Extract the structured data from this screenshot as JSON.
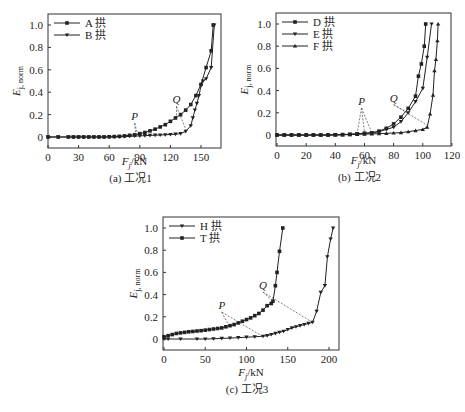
{
  "chart_data": [
    {
      "type": "line",
      "panel": "a",
      "caption": "(a) 工况1",
      "xlabel": "F_j/kN",
      "ylabel": "E_j, norm",
      "xlim": [
        0,
        170
      ],
      "ylim": [
        -0.1,
        1.1
      ],
      "xticks": [
        0,
        30,
        60,
        90,
        120,
        150
      ],
      "yticks": [
        0,
        0.2,
        0.4,
        0.6,
        0.8,
        1.0
      ],
      "ytick_labels": [
        "0",
        "0.2",
        "0.4",
        "0.6",
        "0.8",
        "1.0"
      ],
      "legend_position": "upper-left",
      "series": [
        {
          "name": "A 拱",
          "marker": "square",
          "x": [
            0,
            10,
            20,
            25,
            30,
            35,
            40,
            45,
            50,
            55,
            60,
            65,
            70,
            75,
            80,
            85,
            90,
            95,
            100,
            105,
            110,
            115,
            120,
            125,
            130,
            135,
            140,
            145,
            150,
            155,
            160,
            162
          ],
          "y": [
            0,
            0,
            0,
            0,
            0,
            0,
            0,
            0,
            0,
            0,
            0.002,
            0.004,
            0.006,
            0.01,
            0.015,
            0.02,
            0.03,
            0.04,
            0.055,
            0.07,
            0.09,
            0.11,
            0.14,
            0.17,
            0.2,
            0.24,
            0.29,
            0.37,
            0.47,
            0.62,
            0.77,
            1.0
          ]
        },
        {
          "name": "B 拱",
          "marker": "triangle-down",
          "x": [
            0,
            10,
            20,
            25,
            30,
            35,
            40,
            45,
            50,
            55,
            60,
            65,
            70,
            75,
            80,
            85,
            90,
            95,
            100,
            105,
            110,
            115,
            120,
            125,
            130,
            135,
            140,
            142,
            144,
            146,
            148,
            150,
            152,
            155,
            160,
            163
          ],
          "y": [
            0,
            0,
            0,
            0,
            0,
            0,
            0,
            0,
            0,
            0,
            0,
            0,
            0.002,
            0.004,
            0.006,
            0.008,
            0.01,
            0.012,
            0.014,
            0.016,
            0.018,
            0.02,
            0.022,
            0.025,
            0.03,
            0.05,
            0.1,
            0.17,
            0.24,
            0.3,
            0.37,
            0.46,
            0.5,
            0.52,
            0.62,
            1.0
          ]
        }
      ],
      "annotations": [
        {
          "text": "P",
          "x": 85,
          "y": 0.15,
          "points_to": [
            [
              86,
              0.02
            ],
            [
              88,
              0.02
            ]
          ]
        },
        {
          "text": "Q",
          "x": 126,
          "y": 0.3,
          "points_to": [
            [
              126,
              0.18
            ],
            [
              136,
              0.05
            ]
          ]
        }
      ]
    },
    {
      "type": "line",
      "panel": "b",
      "caption": "(b) 工况2",
      "xlabel": "F_j/kN",
      "ylabel": "E_j, norm",
      "xlim": [
        0,
        120
      ],
      "ylim": [
        -0.1,
        1.1
      ],
      "xticks": [
        0,
        20,
        40,
        60,
        80,
        100,
        120
      ],
      "yticks": [
        0,
        0.2,
        0.4,
        0.6,
        0.8,
        1.0
      ],
      "ytick_labels": [
        "0",
        "0.2",
        "0.4",
        "0.6",
        "0.8",
        "1.0"
      ],
      "legend_position": "upper-left",
      "series": [
        {
          "name": "D 拱",
          "marker": "square",
          "x": [
            0,
            5,
            10,
            15,
            20,
            25,
            30,
            35,
            40,
            45,
            50,
            55,
            60,
            65,
            70,
            75,
            80,
            85,
            90,
            95,
            97,
            99,
            101,
            102
          ],
          "y": [
            0,
            0,
            0,
            0,
            0,
            0,
            0,
            0,
            0.002,
            0.004,
            0.006,
            0.01,
            0.015,
            0.02,
            0.035,
            0.06,
            0.1,
            0.16,
            0.24,
            0.35,
            0.53,
            0.64,
            0.8,
            1.0
          ]
        },
        {
          "name": "E 拱",
          "marker": "triangle-down",
          "x": [
            0,
            5,
            10,
            15,
            20,
            25,
            30,
            35,
            40,
            45,
            50,
            55,
            60,
            65,
            70,
            75,
            80,
            85,
            90,
            95,
            100,
            103,
            106
          ],
          "y": [
            0,
            0,
            0,
            0,
            0,
            0,
            0,
            0,
            0.002,
            0.004,
            0.006,
            0.01,
            0.015,
            0.02,
            0.03,
            0.05,
            0.07,
            0.12,
            0.2,
            0.3,
            0.42,
            0.7,
            1.0
          ]
        },
        {
          "name": "F 拱",
          "marker": "triangle-up",
          "x": [
            0,
            5,
            10,
            15,
            20,
            25,
            30,
            35,
            40,
            45,
            50,
            55,
            60,
            65,
            70,
            75,
            80,
            85,
            90,
            95,
            100,
            103,
            105,
            107,
            108,
            109,
            110,
            110.5
          ],
          "y": [
            0,
            0,
            0,
            0,
            0,
            0,
            0,
            0,
            0,
            0.002,
            0.004,
            0.006,
            0.008,
            0.01,
            0.012,
            0.015,
            0.018,
            0.022,
            0.03,
            0.04,
            0.05,
            0.07,
            0.19,
            0.36,
            0.58,
            0.68,
            0.85,
            1.0
          ]
        }
      ],
      "annotations": [
        {
          "text": "P",
          "x": 58,
          "y": 0.27,
          "points_to": [
            [
              55,
              0.02
            ],
            [
              60,
              0.02
            ],
            [
              65,
              0.02
            ]
          ]
        },
        {
          "text": "Q",
          "x": 80,
          "y": 0.3,
          "points_to": [
            [
              90,
              0.2
            ],
            [
              104,
              0.08
            ]
          ]
        }
      ]
    },
    {
      "type": "line",
      "panel": "c",
      "caption": "(c) 工况3",
      "xlabel": "F_j/kN",
      "ylabel": "E_j, norm",
      "xlim": [
        0,
        212
      ],
      "ylim": [
        -0.1,
        1.1
      ],
      "xticks": [
        0,
        50,
        100,
        150,
        200
      ],
      "yticks": [
        0,
        0.2,
        0.4,
        0.6,
        0.8,
        1.0
      ],
      "ytick_labels": [
        "0",
        "0.2",
        "0.4",
        "0.6",
        "0.8",
        "1.0"
      ],
      "legend_position": "upper-left",
      "series": [
        {
          "name": "H 拱",
          "marker": "triangle-down",
          "x": [
            0,
            5,
            20,
            40,
            50,
            60,
            70,
            80,
            90,
            100,
            110,
            120,
            125,
            130,
            135,
            140,
            145,
            150,
            155,
            160,
            165,
            170,
            175,
            180,
            185,
            190,
            195,
            198,
            202,
            205
          ],
          "y": [
            0,
            0,
            0,
            0,
            0,
            0.002,
            0.005,
            0.008,
            0.012,
            0.016,
            0.02,
            0.025,
            0.03,
            0.04,
            0.05,
            0.06,
            0.07,
            0.085,
            0.1,
            0.11,
            0.12,
            0.13,
            0.14,
            0.15,
            0.25,
            0.42,
            0.48,
            0.74,
            0.9,
            1.0
          ]
        },
        {
          "name": "T 拱",
          "marker": "square",
          "x": [
            0,
            5,
            10,
            15,
            20,
            25,
            30,
            35,
            40,
            45,
            50,
            55,
            60,
            65,
            70,
            75,
            80,
            85,
            90,
            95,
            100,
            105,
            110,
            115,
            120,
            125,
            130,
            132,
            135,
            137,
            140,
            144
          ],
          "y": [
            0.02,
            0.03,
            0.04,
            0.05,
            0.055,
            0.06,
            0.065,
            0.068,
            0.072,
            0.075,
            0.08,
            0.085,
            0.09,
            0.095,
            0.1,
            0.11,
            0.12,
            0.13,
            0.145,
            0.16,
            0.175,
            0.19,
            0.21,
            0.23,
            0.26,
            0.3,
            0.32,
            0.34,
            0.48,
            0.6,
            0.79,
            1.0
          ]
        }
      ],
      "annotations": [
        {
          "text": "P",
          "x": 70,
          "y": 0.27,
          "points_to": [
            [
              78,
              0.13
            ],
            [
              118,
              0.03
            ]
          ]
        },
        {
          "text": "Q",
          "x": 120,
          "y": 0.45,
          "points_to": [
            [
              132,
              0.34
            ],
            [
              180,
              0.15
            ]
          ]
        }
      ]
    }
  ]
}
